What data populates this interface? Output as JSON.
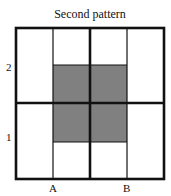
{
  "title": "Second pattern",
  "y_labels": [
    {
      "text": "2",
      "y": 62
    },
    {
      "text": "1",
      "y": 132
    }
  ],
  "x_labels": [
    {
      "text": "A",
      "x": 49
    },
    {
      "text": "B",
      "x": 123
    }
  ],
  "colors": {
    "line": "#111111",
    "fill": "#808080",
    "background": "#ffffff"
  },
  "grid": {
    "left": 16,
    "right": 164,
    "top": 28,
    "bottom": 179,
    "thin_columns": [
      53,
      127
    ],
    "thick_column": 90,
    "thick_row": 103,
    "shaded_region": {
      "x1": 53,
      "x2": 127,
      "y1": 65,
      "y2": 142
    }
  }
}
